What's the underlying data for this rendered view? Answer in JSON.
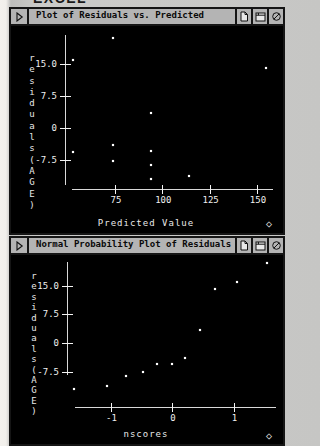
{
  "page_header": "EXCEL",
  "colors": {
    "page_bg": "#c6c6c4",
    "plot_bg": "#000000",
    "plot_fg": "#ffffff",
    "titlebar_bg": "#b4b4b4",
    "border": "#151515"
  },
  "icons": {
    "menu_glyph": "triangle-right",
    "titlebar_buttons": [
      "new-page-icon",
      "window-icon",
      "cancel-icon"
    ],
    "resize_glyph": "◇"
  },
  "windows": [
    {
      "title": "Plot of Residuals vs. Predicted"
    },
    {
      "title": "Normal Probability Plot of Residuals"
    }
  ],
  "chart_data": [
    {
      "type": "scatter",
      "title": "Plot of Residuals vs. Predicted",
      "xlabel": "Predicted Value",
      "ylabel": "residuals(AGE)",
      "x_ticks": {
        "values": [
          75,
          100,
          125,
          150
        ],
        "labels": [
          "75",
          "100",
          "125",
          "150"
        ]
      },
      "y_ticks": {
        "values": [
          15,
          7.5,
          0,
          -7.5
        ],
        "labels": [
          "15.0",
          "7.5",
          "0",
          "-7.5"
        ]
      },
      "xlim": [
        50,
        160
      ],
      "ylim": [
        -15,
        23
      ],
      "grid": false,
      "points": [
        [
          74,
          21
        ],
        [
          53,
          16
        ],
        [
          155,
          14
        ],
        [
          94,
          3.5
        ],
        [
          74,
          -4
        ],
        [
          53,
          -5.6
        ],
        [
          94,
          -5.4
        ],
        [
          74,
          -7.7
        ],
        [
          94,
          -8.7
        ],
        [
          114,
          -11.3
        ],
        [
          94,
          -12
        ]
      ]
    },
    {
      "type": "scatter",
      "title": "Normal Probability Plot of Residuals",
      "xlabel": "nscores",
      "ylabel": "residuals(AGE)",
      "x_ticks": {
        "values": [
          -1,
          0,
          1
        ],
        "labels": [
          "-1",
          "0",
          "1"
        ]
      },
      "y_ticks": {
        "values": [
          15,
          7.5,
          0,
          -7.5
        ],
        "labels": [
          "15.0",
          "7.5",
          "0",
          "-7.5"
        ]
      },
      "xlim": [
        -1.8,
        1.8
      ],
      "ylim": [
        -15,
        23
      ],
      "grid": false,
      "points": [
        [
          -1.59,
          -12
        ],
        [
          -1.05,
          -11.3
        ],
        [
          -0.75,
          -8.7
        ],
        [
          -0.47,
          -7.7
        ],
        [
          -0.24,
          -5.6
        ],
        [
          0,
          -5.4
        ],
        [
          0.21,
          -4
        ],
        [
          0.46,
          3.5
        ],
        [
          0.7,
          14
        ],
        [
          1.06,
          16
        ],
        [
          1.55,
          21
        ]
      ]
    }
  ]
}
